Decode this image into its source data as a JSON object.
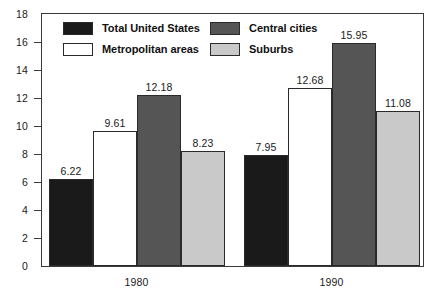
{
  "chart_data": {
    "type": "bar",
    "title": "",
    "subtitle": "",
    "xlabel": "",
    "ylabel": "",
    "categories": [
      "1980",
      "1990"
    ],
    "series": [
      {
        "name": "Total United States",
        "values": [
          6.22,
          7.95
        ],
        "color": "#1a1a1a"
      },
      {
        "name": "Metropolitan areas",
        "values": [
          9.61,
          12.68
        ],
        "color": "#ffffff"
      },
      {
        "name": "Central cities",
        "values": [
          12.18,
          15.95
        ],
        "color": "#555555"
      },
      {
        "name": "Suburbs",
        "values": [
          8.23,
          11.08
        ],
        "color": "#c9c9c9"
      }
    ],
    "ylim": [
      0,
      18
    ],
    "yticks": [
      0,
      2,
      4,
      6,
      8,
      10,
      12,
      14,
      16,
      18
    ],
    "ytick_labels": [
      "0",
      "2",
      "4",
      "6",
      "8",
      "10",
      "12",
      "14",
      "16",
      "18"
    ],
    "grid": false,
    "legend_position": "top-inside",
    "data_labels": [
      "6.22",
      "9.61",
      "12.18",
      "8.23",
      "7.95",
      "12.68",
      "15.95",
      "11.08"
    ]
  },
  "legend": {
    "entries": [
      {
        "label": "Total United States",
        "swatch": "black-swatch"
      },
      {
        "label": "Metropolitan areas",
        "swatch": "white-swatch"
      },
      {
        "label": "Central cities",
        "swatch": "dark-gray-swatch"
      },
      {
        "label": "Suburbs",
        "swatch": "light-gray-swatch"
      }
    ]
  },
  "axes": {
    "y_labels": [
      "18",
      "16",
      "14",
      "12",
      "10",
      "8",
      "6",
      "4",
      "2",
      "0"
    ],
    "x_labels": [
      "1980",
      "1990"
    ]
  },
  "bars": [
    {
      "group": "1980",
      "series": "Total United States",
      "value": 6.22,
      "label": "6.22"
    },
    {
      "group": "1980",
      "series": "Metropolitan areas",
      "value": 9.61,
      "label": "9.61"
    },
    {
      "group": "1980",
      "series": "Central cities",
      "value": 12.18,
      "label": "12.18"
    },
    {
      "group": "1980",
      "series": "Suburbs",
      "value": 8.23,
      "label": "8.23"
    },
    {
      "group": "1990",
      "series": "Total United States",
      "value": 7.95,
      "label": "7.95"
    },
    {
      "group": "1990",
      "series": "Metropolitan areas",
      "value": 12.68,
      "label": "12.68"
    },
    {
      "group": "1990",
      "series": "Central cities",
      "value": 15.95,
      "label": "15.95"
    },
    {
      "group": "1990",
      "series": "Suburbs",
      "value": 11.08,
      "label": "11.08"
    }
  ]
}
